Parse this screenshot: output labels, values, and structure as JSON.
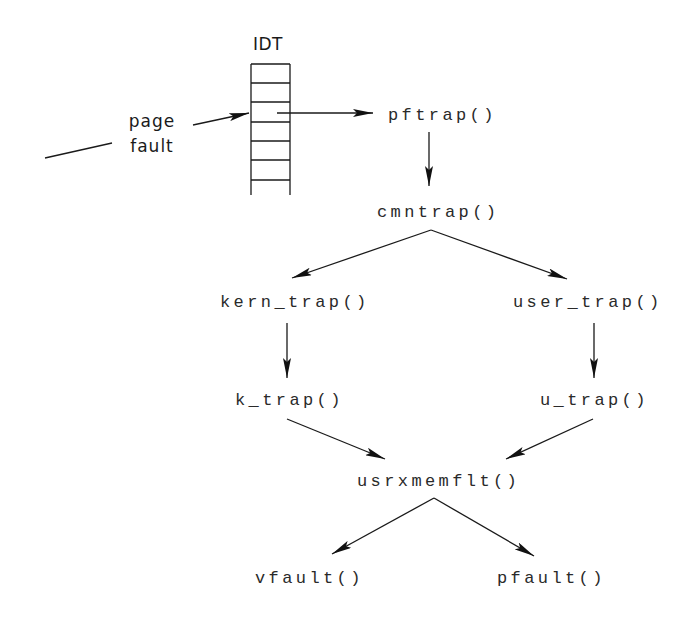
{
  "diagram": {
    "type": "call-flow",
    "idt": {
      "title": "IDT",
      "entries": 7
    },
    "event": {
      "line1": "page",
      "line2": "fault"
    },
    "nodes": {
      "pftrap": "pftrap()",
      "cmntrap": "cmntrap()",
      "kern_trap": "kern_trap()",
      "user_trap": "user_trap()",
      "k_trap": "k_trap()",
      "u_trap": "u_trap()",
      "usrxmemflt": "usrxmemflt()",
      "vfault": "vfault()",
      "pfault": "pfault()"
    },
    "edges": [
      {
        "from": "page fault",
        "to": "IDT"
      },
      {
        "from": "IDT",
        "to": "pftrap()"
      },
      {
        "from": "pftrap()",
        "to": "cmntrap()"
      },
      {
        "from": "cmntrap()",
        "to": "kern_trap()"
      },
      {
        "from": "cmntrap()",
        "to": "user_trap()"
      },
      {
        "from": "kern_trap()",
        "to": "k_trap()"
      },
      {
        "from": "user_trap()",
        "to": "u_trap()"
      },
      {
        "from": "k_trap()",
        "to": "usrxmemflt()"
      },
      {
        "from": "u_trap()",
        "to": "usrxmemflt()"
      },
      {
        "from": "usrxmemflt()",
        "to": "vfault()"
      },
      {
        "from": "usrxmemflt()",
        "to": "pfault()"
      }
    ],
    "colors": {
      "background": "#ffffff",
      "ink": "#1a1a1a"
    }
  }
}
